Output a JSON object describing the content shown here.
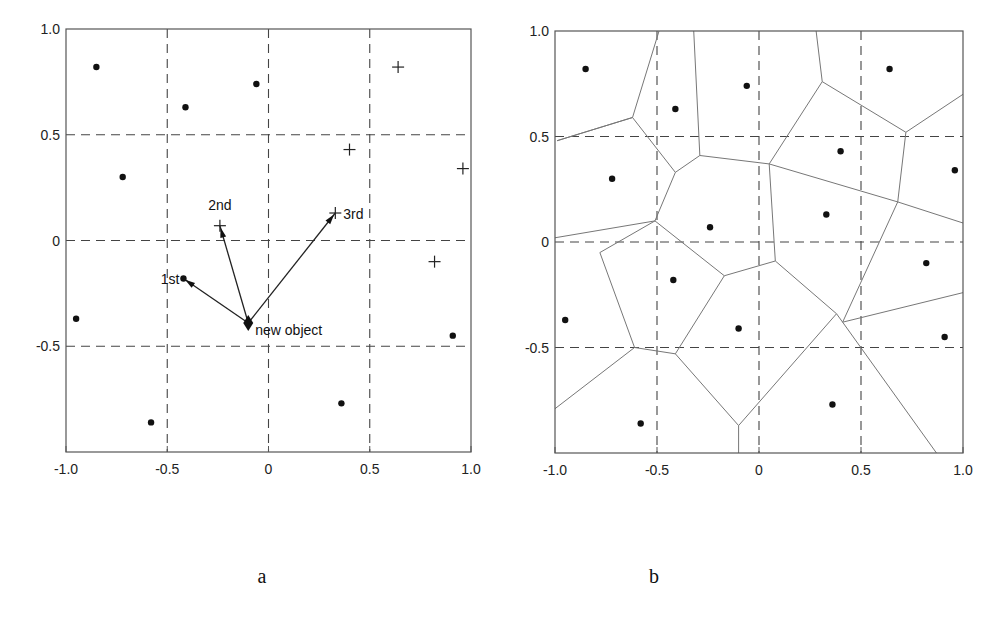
{
  "figure": {
    "panels": [
      {
        "id": "a",
        "label": "a"
      },
      {
        "id": "b",
        "label": "b"
      }
    ]
  },
  "chart_data": [
    {
      "type": "scatter",
      "panel": "a",
      "title": "",
      "xlabel": "",
      "ylabel": "",
      "xlim": [
        -1.0,
        1.0
      ],
      "ylim": [
        -1.0,
        1.0
      ],
      "x_ticks": [
        "-1.0",
        "-0.5",
        "0",
        "0.5",
        "1.0"
      ],
      "y_ticks": [
        "1.0",
        "0.5",
        "0",
        "-0.5"
      ],
      "x_tick_values": [
        -1.0,
        -0.5,
        0,
        0.5,
        1.0
      ],
      "y_tick_values": [
        1.0,
        0.5,
        0,
        -0.5
      ],
      "grid": "dashed at ±0.5 and 0",
      "series": [
        {
          "name": "dots",
          "marker": "dot",
          "points": [
            [
              -0.85,
              0.82
            ],
            [
              -0.41,
              0.63
            ],
            [
              -0.06,
              0.74
            ],
            [
              -0.72,
              0.3
            ],
            [
              -0.42,
              -0.18
            ],
            [
              -0.95,
              -0.37
            ],
            [
              -0.58,
              -0.86
            ],
            [
              0.36,
              -0.77
            ],
            [
              0.91,
              -0.45
            ]
          ]
        },
        {
          "name": "crosses",
          "marker": "plus",
          "points": [
            [
              0.64,
              0.82
            ],
            [
              0.4,
              0.43
            ],
            [
              0.96,
              0.34
            ],
            [
              -0.24,
              0.07
            ],
            [
              0.33,
              0.13
            ],
            [
              0.82,
              -0.1
            ]
          ]
        },
        {
          "name": "new object",
          "marker": "diamond",
          "points": [
            [
              -0.1,
              -0.39
            ]
          ]
        }
      ],
      "arrows": [
        {
          "from": [
            -0.1,
            -0.39
          ],
          "to": [
            -0.42,
            -0.18
          ],
          "label": "1st"
        },
        {
          "from": [
            -0.1,
            -0.39
          ],
          "to": [
            -0.24,
            0.07
          ],
          "label": "2nd"
        },
        {
          "from": [
            -0.1,
            -0.39
          ],
          "to": [
            0.33,
            0.13
          ],
          "label": "3rd"
        }
      ],
      "annotations": [
        {
          "text": "1st",
          "at": [
            -0.42,
            -0.18
          ]
        },
        {
          "text": "2nd",
          "at": [
            -0.24,
            0.07
          ]
        },
        {
          "text": "3rd",
          "at": [
            0.33,
            0.13
          ]
        },
        {
          "text": "new object",
          "at": [
            -0.1,
            -0.39
          ]
        }
      ]
    },
    {
      "type": "scatter",
      "panel": "b",
      "title": "",
      "subtype": "voronoi diagram",
      "xlabel": "",
      "ylabel": "",
      "xlim": [
        -1.0,
        1.0
      ],
      "ylim": [
        -1.0,
        1.0
      ],
      "x_ticks": [
        "-1.0",
        "-0.5",
        "0",
        "0.5",
        "1.0"
      ],
      "y_ticks": [
        "1.0",
        "0.5",
        "0",
        "-0.5"
      ],
      "x_tick_values": [
        -1.0,
        -0.5,
        0,
        0.5,
        1.0
      ],
      "y_tick_values": [
        1.0,
        0.5,
        0,
        -0.5
      ],
      "grid": "dashed at ±0.5 and 0",
      "series": [
        {
          "name": "sites",
          "marker": "dot",
          "points": [
            [
              -0.85,
              0.82
            ],
            [
              -0.41,
              0.63
            ],
            [
              -0.06,
              0.74
            ],
            [
              -0.72,
              0.3
            ],
            [
              -0.42,
              -0.18
            ],
            [
              -0.95,
              -0.37
            ],
            [
              -0.58,
              -0.86
            ],
            [
              0.36,
              -0.77
            ],
            [
              0.91,
              -0.45
            ],
            [
              0.64,
              0.82
            ],
            [
              0.4,
              0.43
            ],
            [
              0.96,
              0.34
            ],
            [
              -0.24,
              0.07
            ],
            [
              0.33,
              0.13
            ],
            [
              0.82,
              -0.1
            ],
            [
              -0.1,
              -0.41
            ]
          ]
        }
      ],
      "voronoi_edges": [
        [
          [
            -0.99,
            0.48
          ],
          [
            -0.62,
            0.59
          ]
        ],
        [
          [
            -0.62,
            0.59
          ],
          [
            -0.99,
            0.48
          ]
        ],
        [
          [
            -0.62,
            0.59
          ],
          [
            -0.49,
            1.0
          ]
        ],
        [
          [
            -0.62,
            0.59
          ],
          [
            -0.41,
            0.33
          ]
        ],
        [
          [
            -0.41,
            0.33
          ],
          [
            -0.29,
            0.41
          ]
        ],
        [
          [
            -0.29,
            0.41
          ],
          [
            -0.32,
            1.0
          ]
        ],
        [
          [
            -0.41,
            0.33
          ],
          [
            -0.51,
            0.1
          ]
        ],
        [
          [
            -0.51,
            0.1
          ],
          [
            -1.0,
            0.02
          ]
        ],
        [
          [
            -0.51,
            0.1
          ],
          [
            -0.78,
            -0.05
          ]
        ],
        [
          [
            -0.29,
            0.41
          ],
          [
            0.05,
            0.37
          ]
        ],
        [
          [
            0.05,
            0.37
          ],
          [
            0.31,
            0.76
          ]
        ],
        [
          [
            0.31,
            0.76
          ],
          [
            0.28,
            1.0
          ]
        ],
        [
          [
            0.31,
            0.76
          ],
          [
            0.72,
            0.52
          ]
        ],
        [
          [
            0.72,
            0.52
          ],
          [
            1.0,
            0.7
          ]
        ],
        [
          [
            0.05,
            0.37
          ],
          [
            0.68,
            0.19
          ]
        ],
        [
          [
            0.68,
            0.19
          ],
          [
            0.72,
            0.52
          ]
        ],
        [
          [
            0.68,
            0.19
          ],
          [
            1.0,
            0.09
          ]
        ],
        [
          [
            0.05,
            0.37
          ],
          [
            0.08,
            -0.09
          ]
        ],
        [
          [
            -0.51,
            0.1
          ],
          [
            -0.17,
            -0.16
          ]
        ],
        [
          [
            -0.17,
            -0.16
          ],
          [
            0.08,
            -0.09
          ]
        ],
        [
          [
            -0.17,
            -0.16
          ],
          [
            -0.41,
            -0.53
          ]
        ],
        [
          [
            -0.78,
            -0.05
          ],
          [
            -0.61,
            -0.5
          ]
        ],
        [
          [
            -0.61,
            -0.5
          ],
          [
            -0.41,
            -0.53
          ]
        ],
        [
          [
            -0.61,
            -0.5
          ],
          [
            -1.0,
            -0.79
          ]
        ],
        [
          [
            -0.41,
            -0.53
          ],
          [
            -0.1,
            -0.87
          ]
        ],
        [
          [
            -0.1,
            -0.87
          ],
          [
            -0.1,
            -1.0
          ]
        ],
        [
          [
            -0.1,
            -0.87
          ],
          [
            0.38,
            -0.34
          ]
        ],
        [
          [
            0.08,
            -0.09
          ],
          [
            0.38,
            -0.34
          ]
        ],
        [
          [
            0.38,
            -0.34
          ],
          [
            0.41,
            -0.38
          ]
        ],
        [
          [
            0.41,
            -0.38
          ],
          [
            0.68,
            0.19
          ]
        ],
        [
          [
            0.41,
            -0.38
          ],
          [
            1.0,
            -0.24
          ]
        ],
        [
          [
            0.41,
            -0.38
          ],
          [
            0.87,
            -1.0
          ]
        ]
      ]
    }
  ]
}
